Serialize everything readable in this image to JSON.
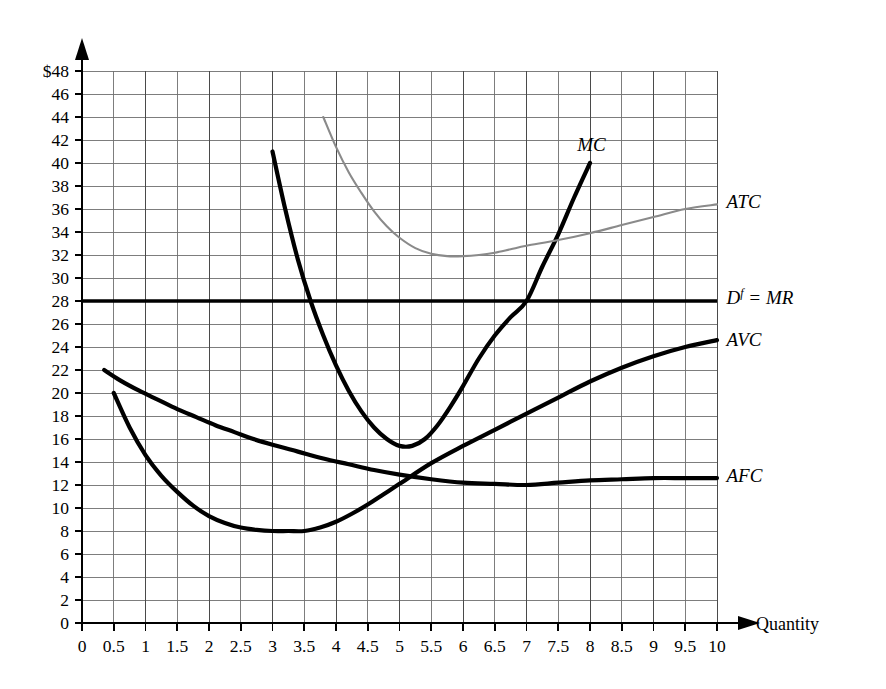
{
  "chart_data": {
    "type": "line",
    "title": "",
    "xlabel": "Quantity",
    "ylabel": "",
    "xlim": [
      0,
      10
    ],
    "ylim": [
      0,
      48
    ],
    "grid": true,
    "legend_position": "right-inline-labels",
    "x_ticks": [
      "0",
      "0.5",
      "1",
      "1.5",
      "2",
      "2.5",
      "3",
      "3.5",
      "4",
      "4.5",
      "5",
      "5.5",
      "6",
      "6.5",
      "7",
      "7.5",
      "8",
      "8.5",
      "9",
      "9.5",
      "10"
    ],
    "y_ticks": [
      "0",
      "2",
      "4",
      "6",
      "8",
      "10",
      "12",
      "14",
      "16",
      "18",
      "20",
      "22",
      "24",
      "26",
      "28",
      "30",
      "32",
      "34",
      "36",
      "38",
      "40",
      "42",
      "44",
      "46",
      "$48"
    ],
    "y_tick_values": [
      0,
      2,
      4,
      6,
      8,
      10,
      12,
      14,
      16,
      18,
      20,
      22,
      24,
      26,
      28,
      30,
      32,
      34,
      36,
      38,
      40,
      42,
      44,
      46,
      48
    ],
    "x_tick_values": [
      0,
      0.5,
      1,
      1.5,
      2,
      2.5,
      3,
      3.5,
      4,
      4.5,
      5,
      5.5,
      6,
      6.5,
      7,
      7.5,
      8,
      8.5,
      9,
      9.5,
      10
    ],
    "series": [
      {
        "name": "MC",
        "label": "MC",
        "style": "thick-black",
        "color": "#000000",
        "label_x": 7.8,
        "label_y": 41.6,
        "points": [
          [
            3.0,
            41.0
          ],
          [
            3.2,
            36.0
          ],
          [
            3.4,
            31.6
          ],
          [
            3.6,
            28.0
          ],
          [
            3.8,
            25.0
          ],
          [
            4.0,
            22.4
          ],
          [
            4.2,
            20.2
          ],
          [
            4.4,
            18.4
          ],
          [
            4.6,
            17.0
          ],
          [
            4.8,
            16.0
          ],
          [
            5.0,
            15.4
          ],
          [
            5.2,
            15.4
          ],
          [
            5.4,
            16.0
          ],
          [
            5.6,
            17.2
          ],
          [
            5.8,
            18.8
          ],
          [
            6.0,
            20.6
          ],
          [
            6.25,
            23.0
          ],
          [
            6.5,
            25.0
          ],
          [
            6.75,
            26.6
          ],
          [
            7.0,
            28.0
          ],
          [
            7.25,
            31.0
          ],
          [
            7.5,
            33.8
          ],
          [
            7.75,
            37.0
          ],
          [
            8.0,
            40.0
          ]
        ]
      },
      {
        "name": "ATC",
        "label": "ATC",
        "style": "thin-gray",
        "color": "#8a8a8a",
        "label_x": 10.15,
        "label_y": 36.6,
        "points": [
          [
            3.8,
            44.0
          ],
          [
            4.0,
            41.4
          ],
          [
            4.2,
            39.2
          ],
          [
            4.4,
            37.4
          ],
          [
            4.6,
            35.8
          ],
          [
            4.8,
            34.5
          ],
          [
            5.0,
            33.5
          ],
          [
            5.25,
            32.6
          ],
          [
            5.5,
            32.1
          ],
          [
            5.75,
            31.9
          ],
          [
            6.0,
            31.9
          ],
          [
            6.25,
            32.0
          ],
          [
            6.5,
            32.2
          ],
          [
            6.75,
            32.5
          ],
          [
            7.0,
            32.8
          ],
          [
            7.5,
            33.3
          ],
          [
            8.0,
            33.9
          ],
          [
            8.5,
            34.6
          ],
          [
            9.0,
            35.3
          ],
          [
            9.5,
            36.0
          ],
          [
            10.0,
            36.4
          ]
        ]
      },
      {
        "name": "Df = MR",
        "label": "Dƒ = MR",
        "style": "thick-black-horizontal",
        "color": "#000000",
        "label_x": 10.15,
        "label_y": 28.3,
        "value": 28,
        "points": [
          [
            0.0,
            28.0
          ],
          [
            10.0,
            28.0
          ]
        ]
      },
      {
        "name": "AVC",
        "label": "AVC",
        "style": "thick-black",
        "color": "#000000",
        "label_x": 10.15,
        "label_y": 24.6,
        "points": [
          [
            0.5,
            20.0
          ],
          [
            0.75,
            17.0
          ],
          [
            1.0,
            14.6
          ],
          [
            1.25,
            12.8
          ],
          [
            1.5,
            11.4
          ],
          [
            1.75,
            10.2
          ],
          [
            2.0,
            9.3
          ],
          [
            2.25,
            8.7
          ],
          [
            2.5,
            8.3
          ],
          [
            2.75,
            8.1
          ],
          [
            3.0,
            8.0
          ],
          [
            3.25,
            8.0
          ],
          [
            3.5,
            8.0
          ],
          [
            3.75,
            8.3
          ],
          [
            4.0,
            8.8
          ],
          [
            4.25,
            9.5
          ],
          [
            4.5,
            10.3
          ],
          [
            4.75,
            11.2
          ],
          [
            5.0,
            12.1
          ],
          [
            5.5,
            13.9
          ],
          [
            6.0,
            15.4
          ],
          [
            6.5,
            16.8
          ],
          [
            7.0,
            18.2
          ],
          [
            7.5,
            19.6
          ],
          [
            8.0,
            21.0
          ],
          [
            8.5,
            22.2
          ],
          [
            9.0,
            23.2
          ],
          [
            9.5,
            24.0
          ],
          [
            10.0,
            24.6
          ]
        ]
      },
      {
        "name": "AFC",
        "label": "AFC",
        "style": "thick-black",
        "color": "#000000",
        "label_x": 10.15,
        "label_y": 12.8,
        "points": [
          [
            0.35,
            22.0
          ],
          [
            0.6,
            21.1
          ],
          [
            0.9,
            20.2
          ],
          [
            1.2,
            19.4
          ],
          [
            1.5,
            18.6
          ],
          [
            1.8,
            17.9
          ],
          [
            2.1,
            17.2
          ],
          [
            2.4,
            16.6
          ],
          [
            2.7,
            16.0
          ],
          [
            3.0,
            15.5
          ],
          [
            3.4,
            14.9
          ],
          [
            3.8,
            14.3
          ],
          [
            4.2,
            13.8
          ],
          [
            4.6,
            13.3
          ],
          [
            5.0,
            12.9
          ],
          [
            5.5,
            12.5
          ],
          [
            6.0,
            12.2
          ],
          [
            6.5,
            12.1
          ],
          [
            7.0,
            12.0
          ],
          [
            7.5,
            12.2
          ],
          [
            8.0,
            12.4
          ],
          [
            8.5,
            12.5
          ],
          [
            9.0,
            12.6
          ],
          [
            9.5,
            12.6
          ],
          [
            10.0,
            12.6
          ]
        ]
      }
    ]
  },
  "axes": {
    "x_axis_title": "Quantity",
    "y_axis_top_label": "$48"
  }
}
